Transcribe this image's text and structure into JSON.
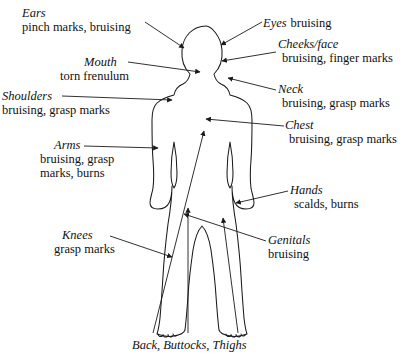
{
  "diagram": {
    "figure_name": "child-body-outline",
    "stroke_color": "#1a1a1a",
    "background_color": "#ffffff",
    "caption": "Back, Buttocks, Thighs",
    "labels": [
      {
        "id": "ears",
        "head": "Ears",
        "desc": "pinch marks, bruising"
      },
      {
        "id": "mouth",
        "head": "Mouth",
        "desc": "torn frenulum"
      },
      {
        "id": "shoulders",
        "head": "Shoulders",
        "desc": "bruising, grasp marks"
      },
      {
        "id": "arms",
        "head": "Arms",
        "desc": "bruising, grasp marks, burns"
      },
      {
        "id": "knees",
        "head": "Knees",
        "desc": "grasp marks"
      },
      {
        "id": "eyes",
        "head": "Eyes",
        "desc": "bruising"
      },
      {
        "id": "cheeks",
        "head": "Cheeks/face",
        "desc": "bruising, finger marks"
      },
      {
        "id": "neck",
        "head": "Neck",
        "desc": "bruising, grasp marks"
      },
      {
        "id": "chest",
        "head": "Chest",
        "desc": "bruising, grasp marks"
      },
      {
        "id": "hands",
        "head": "Hands",
        "desc": "scalds, burns"
      },
      {
        "id": "genitals",
        "head": "Genitals",
        "desc": "bruising"
      }
    ],
    "arms_desc_line1": "bruising, grasp",
    "arms_desc_line2": "marks, burns"
  }
}
